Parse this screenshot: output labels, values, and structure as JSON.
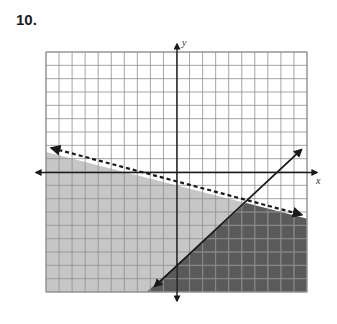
{
  "problem": {
    "number_label": "10."
  },
  "colors": {
    "background": "#ffffff",
    "grid_line": "#8e8e8e",
    "grid_line_on_dark": "#8a8a8a",
    "light_shade": "#c6c6c6",
    "dark_shade": "#5a5a5a",
    "axis": "#1a1a1a",
    "line": "#1a1a1a"
  },
  "chart_data": {
    "type": "graph-of-inequalities",
    "title": "10.",
    "xlabel": "x",
    "ylabel": "y",
    "xlim": [
      -10,
      10
    ],
    "ylim": [
      -9,
      9
    ],
    "grid": true,
    "grid_step": 1,
    "tick_labels": false,
    "lines": [
      {
        "name": "dashed boundary",
        "style": "dashed",
        "equation": "y = -1/4 x - 1",
        "slope": -0.25,
        "intercept": -1,
        "arrows": "both",
        "endpoints": [
          [
            -9.8,
            1.8
          ],
          [
            9.8,
            -3.2
          ]
        ],
        "shaded_side": "below",
        "inequality": "y < -1/4 x - 1"
      },
      {
        "name": "solid boundary",
        "style": "solid",
        "equation": "y = 7/8 x - 7",
        "slope": 0.875,
        "intercept": -7,
        "arrows": "both",
        "endpoints": [
          [
            -1.9,
            -8.8
          ],
          [
            9.8,
            1.9
          ]
        ],
        "shaded_side": "below",
        "inequality": "y <= 7/8 x - 7"
      }
    ],
    "regions": [
      {
        "name": "below dashed line",
        "shade": "light"
      },
      {
        "name": "solution (overlap of both half-planes)",
        "shade": "dark"
      }
    ],
    "intersection_point": [
      5.3,
      -2.3
    ]
  },
  "layout": {
    "grid_left": 46,
    "grid_right": 307,
    "grid_top": 52,
    "grid_bottom": 292,
    "origin_x": 177,
    "origin_y": 172.5,
    "x_axis_left_tip": 32,
    "x_axis_right_tip": 321,
    "y_axis_top_tip": 40,
    "y_axis_bottom_tip": 305,
    "x_label_pos": [
      316,
      184
    ],
    "y_label_pos": [
      182,
      46
    ]
  }
}
